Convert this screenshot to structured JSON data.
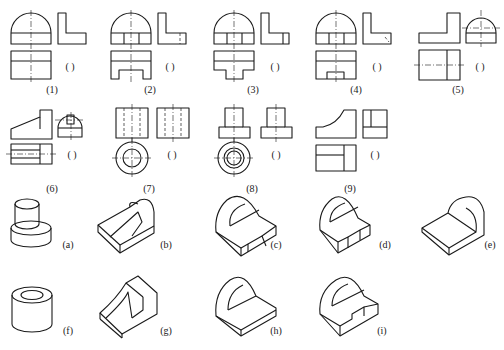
{
  "figure": {
    "problems": [
      {
        "label": "(1)",
        "answer_blank": "(    )"
      },
      {
        "label": "(2)",
        "answer_blank": "(    )"
      },
      {
        "label": "(3)",
        "answer_blank": "(    )"
      },
      {
        "label": "(4)",
        "answer_blank": "(    )"
      },
      {
        "label": "(5)",
        "answer_blank": "(    )"
      },
      {
        "label": "(6)",
        "answer_blank": "(    )"
      },
      {
        "label": "(7)",
        "answer_blank": "(    )"
      },
      {
        "label": "(8)",
        "answer_blank": "(    )"
      },
      {
        "label": "(9)",
        "answer_blank": "(    )"
      }
    ],
    "isometrics": [
      {
        "label": "(a)"
      },
      {
        "label": "(b)"
      },
      {
        "label": "(c)"
      },
      {
        "label": "(d)"
      },
      {
        "label": "(e)"
      },
      {
        "label": "(f)"
      },
      {
        "label": "(g)"
      },
      {
        "label": "(h)"
      },
      {
        "label": "(i)"
      }
    ]
  }
}
